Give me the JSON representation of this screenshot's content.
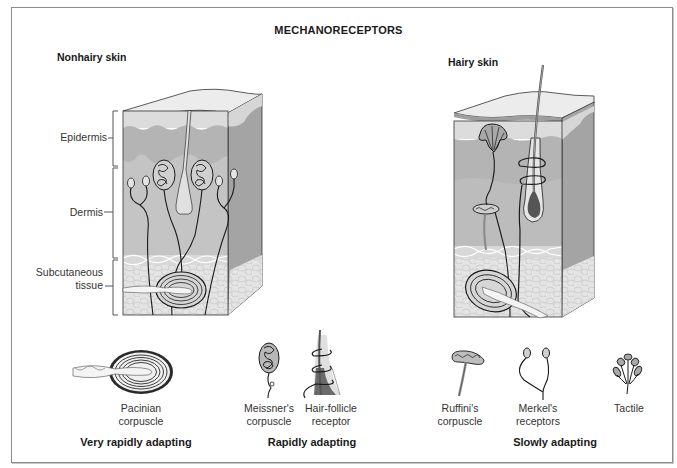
{
  "title": "MECHANORECEPTORS",
  "panels": {
    "nonhairy": {
      "title": "Nonhairy skin",
      "layers": [
        {
          "name": "epidermis",
          "label": "Epidermis"
        },
        {
          "name": "dermis",
          "label": "Dermis"
        },
        {
          "name": "subcutaneous",
          "label_line1": "Subcutaneous",
          "label_line2": "tissue"
        }
      ]
    },
    "hairy": {
      "title": "Hairy skin"
    }
  },
  "receptors": [
    {
      "id": "pacinian",
      "line1": "Pacinian",
      "line2": "corpuscle"
    },
    {
      "id": "meissner",
      "line1": "Meissner's",
      "line2": "corpuscle"
    },
    {
      "id": "hair-follicle",
      "line1": "Hair-follicle",
      "line2": "receptor"
    },
    {
      "id": "ruffini",
      "line1": "Ruffini's",
      "line2": "corpuscle"
    },
    {
      "id": "merkel",
      "line1": "Merkel's",
      "line2": "receptors"
    },
    {
      "id": "tactile",
      "line1": "Tactile",
      "line2": ""
    }
  ],
  "adaptation_groups": [
    {
      "label": "Very rapidly adapting"
    },
    {
      "label": "Rapidly adapting"
    },
    {
      "label": "Slowly adapting"
    }
  ],
  "colors": {
    "frame": "#8c8c8c",
    "epidermis": "#dcdcdc",
    "dermis": "#b4b4b4",
    "side_face": "#a4a4a4",
    "subcutaneous": "#e2e2e2",
    "hair_bulb": "#555555",
    "line": "#1a1a1a"
  }
}
